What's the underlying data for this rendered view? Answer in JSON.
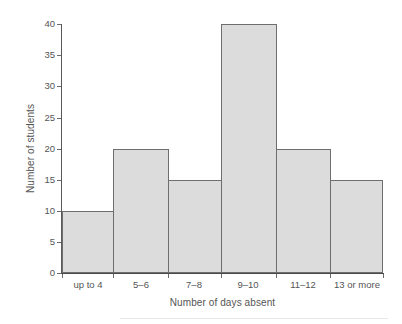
{
  "chart_data": {
    "type": "bar",
    "title": "",
    "subtitle": "",
    "xlabel": "Number of days absent",
    "ylabel": "Number of students",
    "categories": [
      "up to 4",
      "5–6",
      "7–8",
      "9–10",
      "11–12",
      "13 or more"
    ],
    "values": [
      10,
      20,
      15,
      40,
      20,
      15
    ],
    "series": [
      {
        "name": "Number of students",
        "values": [
          10,
          20,
          15,
          40,
          20,
          15
        ]
      }
    ],
    "ylim": [
      0,
      40
    ],
    "yticks": [
      0,
      5,
      10,
      15,
      20,
      25,
      30,
      35,
      40
    ],
    "ytick_labels": [
      "0",
      "5",
      "10",
      "15",
      "20",
      "25",
      "30",
      "35",
      "40"
    ],
    "grid": false,
    "legend": "none",
    "bars_adjacent": true,
    "annotations": [],
    "colors": {
      "bar_fill": "#dcdcdc",
      "bar_edge": "#6e6e6e",
      "axis": "#5a5a5a",
      "text": "#555555",
      "background": "#ffffff"
    }
  }
}
